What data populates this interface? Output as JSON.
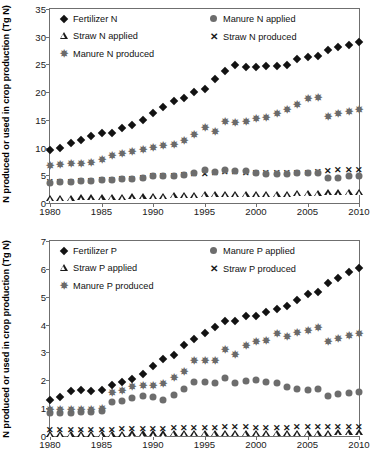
{
  "chart_data": [
    {
      "id": "nitrogen",
      "type": "scatter",
      "title": "",
      "xlabel": "",
      "ylabel": "N produced or used in crop production (Tg N)",
      "xlim": [
        1980,
        2010
      ],
      "ylim": [
        0,
        35
      ],
      "yticks": [
        0,
        5,
        10,
        15,
        20,
        25,
        30,
        35
      ],
      "xticks": [
        1980,
        1985,
        1990,
        1995,
        2000,
        2005,
        2010
      ],
      "grid": false,
      "legend_position": "top-inside",
      "x": [
        1980,
        1981,
        1982,
        1983,
        1984,
        1985,
        1986,
        1987,
        1988,
        1989,
        1990,
        1991,
        1992,
        1993,
        1994,
        1995,
        1996,
        1997,
        1998,
        1999,
        2000,
        2001,
        2002,
        2003,
        2004,
        2005,
        2006,
        2007,
        2008,
        2009,
        2010
      ],
      "series": [
        {
          "name": "Fertilizer N",
          "marker": "diamond",
          "color": "#121212",
          "values": [
            9.6,
            9.9,
            10.8,
            11.3,
            12.0,
            12.6,
            12.7,
            13.6,
            14.0,
            14.9,
            16.2,
            17.4,
            18.4,
            19.0,
            20.0,
            20.6,
            22.3,
            23.8,
            24.9,
            24.6,
            24.5,
            24.8,
            24.8,
            24.9,
            25.9,
            26.3,
            26.6,
            27.6,
            28.1,
            28.5,
            29.1
          ]
        },
        {
          "name": "Manure N produced",
          "marker": "star",
          "color": "#6a6a6a",
          "values": [
            6.7,
            6.8,
            7.0,
            7.1,
            7.3,
            7.7,
            8.4,
            8.8,
            9.2,
            9.6,
            9.9,
            10.3,
            10.5,
            11.1,
            12.2,
            13.5,
            12.8,
            14.6,
            14.4,
            14.7,
            15.1,
            15.4,
            16.1,
            16.8,
            17.7,
            18.7,
            19.0,
            15.5,
            16.0,
            16.4,
            16.8
          ]
        },
        {
          "name": "Straw N produced",
          "marker": "x",
          "color": "#1a1a1a",
          "values": [
            3.7,
            3.7,
            3.8,
            3.9,
            4.0,
            4.1,
            4.2,
            4.3,
            4.4,
            4.5,
            4.8,
            4.8,
            4.9,
            5.1,
            5.3,
            5.3,
            5.4,
            5.6,
            5.6,
            5.5,
            5.4,
            5.4,
            5.4,
            5.4,
            5.5,
            5.5,
            5.6,
            5.8,
            6.0,
            5.9,
            6.0
          ]
        },
        {
          "name": "Manure N applied",
          "marker": "circle",
          "color": "#6d6d6d",
          "values": [
            3.6,
            3.7,
            3.8,
            3.9,
            4.0,
            4.2,
            4.2,
            4.3,
            4.4,
            4.5,
            4.8,
            4.8,
            4.9,
            5.1,
            5.4,
            5.9,
            5.6,
            5.9,
            5.8,
            5.7,
            5.4,
            5.3,
            5.3,
            5.3,
            5.4,
            5.4,
            5.5,
            4.6,
            4.6,
            4.8,
            4.9
          ]
        },
        {
          "name": "Straw N applied",
          "marker": "triangle",
          "color": "#1a1a1a",
          "values": [
            0.9,
            0.9,
            0.9,
            1.0,
            1.0,
            1.0,
            1.1,
            1.1,
            1.2,
            1.2,
            1.3,
            1.3,
            1.4,
            1.4,
            1.5,
            1.6,
            1.6,
            1.7,
            1.7,
            1.7,
            1.7,
            1.7,
            1.7,
            1.7,
            1.8,
            1.8,
            1.8,
            1.9,
            1.9,
            2.0,
            2.0
          ]
        }
      ]
    },
    {
      "id": "phosphorus",
      "type": "scatter",
      "title": "",
      "xlabel": "",
      "ylabel": "N produced or used in crop production (Tg N)",
      "xlim": [
        1980,
        2010
      ],
      "ylim": [
        0,
        7
      ],
      "yticks": [
        0,
        1,
        2,
        3,
        4,
        5,
        6,
        7
      ],
      "xticks": [
        1980,
        1985,
        1990,
        1995,
        2000,
        2005,
        2010
      ],
      "grid": false,
      "legend_position": "top-inside",
      "x": [
        1980,
        1981,
        1982,
        1983,
        1984,
        1985,
        1986,
        1987,
        1988,
        1989,
        1990,
        1991,
        1992,
        1993,
        1994,
        1995,
        1996,
        1997,
        1998,
        1999,
        2000,
        2001,
        2002,
        2003,
        2004,
        2005,
        2006,
        2007,
        2008,
        2009,
        2010
      ],
      "series": [
        {
          "name": "Fertilizer P",
          "marker": "diamond",
          "color": "#121212",
          "values": [
            1.28,
            1.4,
            1.63,
            1.66,
            1.63,
            1.64,
            1.83,
            1.95,
            2.03,
            2.23,
            2.5,
            2.75,
            2.91,
            3.25,
            3.48,
            3.7,
            3.91,
            4.13,
            4.13,
            4.29,
            4.3,
            4.45,
            4.56,
            4.68,
            4.89,
            5.08,
            5.18,
            5.49,
            5.68,
            5.87,
            6.03
          ]
        },
        {
          "name": "Manure P produced",
          "marker": "star",
          "color": "#6a6a6a",
          "values": [
            0.93,
            0.92,
            0.92,
            0.94,
            0.95,
            0.98,
            1.53,
            1.62,
            1.75,
            1.79,
            1.81,
            1.86,
            2.1,
            2.3,
            2.69,
            2.69,
            2.69,
            3.08,
            2.89,
            3.22,
            3.38,
            3.42,
            3.65,
            3.57,
            3.7,
            3.78,
            3.86,
            3.37,
            3.49,
            3.58,
            3.65
          ]
        },
        {
          "name": "Manure P applied",
          "marker": "circle",
          "color": "#6d6d6d",
          "values": [
            0.82,
            0.82,
            0.83,
            0.85,
            0.86,
            0.9,
            1.21,
            1.26,
            1.37,
            1.42,
            1.41,
            1.3,
            1.48,
            1.67,
            1.94,
            1.94,
            1.89,
            2.08,
            1.9,
            1.99,
            2.01,
            1.93,
            1.89,
            1.77,
            1.69,
            1.66,
            1.68,
            1.44,
            1.5,
            1.54,
            1.58
          ]
        },
        {
          "name": "Straw P produced",
          "marker": "x",
          "color": "#1a1a1a",
          "values": [
            0.21,
            0.21,
            0.21,
            0.22,
            0.22,
            0.23,
            0.23,
            0.24,
            0.24,
            0.25,
            0.26,
            0.26,
            0.27,
            0.28,
            0.29,
            0.29,
            0.3,
            0.31,
            0.31,
            0.31,
            0.3,
            0.3,
            0.3,
            0.3,
            0.31,
            0.31,
            0.31,
            0.32,
            0.33,
            0.33,
            0.34
          ]
        },
        {
          "name": "Straw P applied",
          "marker": "triangle",
          "color": "#1a1a1a",
          "values": [
            0.07,
            0.07,
            0.07,
            0.07,
            0.08,
            0.08,
            0.08,
            0.08,
            0.09,
            0.09,
            0.09,
            0.09,
            0.1,
            0.1,
            0.1,
            0.11,
            0.11,
            0.11,
            0.11,
            0.11,
            0.11,
            0.11,
            0.11,
            0.11,
            0.12,
            0.12,
            0.12,
            0.12,
            0.13,
            0.13,
            0.13
          ]
        }
      ]
    }
  ],
  "panels": {
    "top": {
      "ylabel": "N produced or used in crop production (Tg N)",
      "legend": [
        {
          "label": "Fertilizer N",
          "marker": "diamond"
        },
        {
          "label": "Manure N applied",
          "marker": "circle"
        },
        {
          "label": "Straw N applied",
          "marker": "triangle"
        },
        {
          "label": "Straw N produced",
          "marker": "x"
        },
        {
          "label": "Manure N produced",
          "marker": "star"
        }
      ]
    },
    "bottom": {
      "ylabel": "N produced or used in crop production (Tg N)",
      "legend": [
        {
          "label": "Fertilizer P",
          "marker": "diamond"
        },
        {
          "label": "Manure P applied",
          "marker": "circle"
        },
        {
          "label": "Straw P applied",
          "marker": "triangle"
        },
        {
          "label": "Straw P produced",
          "marker": "x"
        },
        {
          "label": "Manure P produced",
          "marker": "star"
        }
      ]
    }
  },
  "colors": {
    "ink": "#121212",
    "gray_marker": "#6d6d6d",
    "axis": "#6f6f6f"
  }
}
